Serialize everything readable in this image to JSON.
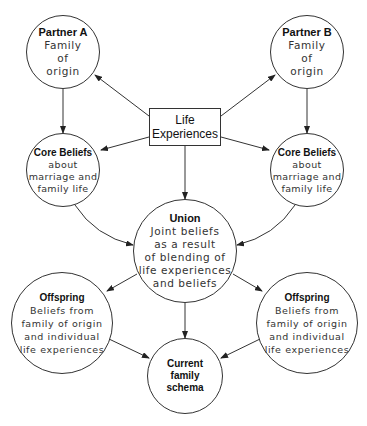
{
  "diagram": {
    "nodes": {
      "partner_a": {
        "title": "Partner A",
        "body": "Family\nof\norigin"
      },
      "partner_b": {
        "title": "Partner B",
        "body": "Family\nof\norigin"
      },
      "life_experiences": {
        "title": "Life\nExperiences"
      },
      "core_beliefs_a": {
        "title": "Core Beliefs",
        "body": "about\nmarriage and\nfamily life"
      },
      "core_beliefs_b": {
        "title": "Core Beliefs",
        "body": "about\nmarriage and\nfamily life"
      },
      "union": {
        "title": "Union",
        "body": "Joint beliefs\nas a result\nof blending of\nlife experiences\nand beliefs"
      },
      "offspring_a": {
        "title": "Offspring",
        "body": "Beliefs from\nfamily of origin\nand individual\nlife experiences"
      },
      "offspring_b": {
        "title": "Offspring",
        "body": "Beliefs from\nfamily of origin\nand individual\nlife experiences"
      },
      "current_schema": {
        "title": "Current\nfamily\nschema"
      }
    },
    "edges": [
      {
        "from": "life_experiences",
        "to": "partner_a"
      },
      {
        "from": "life_experiences",
        "to": "partner_b"
      },
      {
        "from": "life_experiences",
        "to": "core_beliefs_a"
      },
      {
        "from": "life_experiences",
        "to": "core_beliefs_b"
      },
      {
        "from": "life_experiences",
        "to": "union"
      },
      {
        "from": "partner_a",
        "to": "core_beliefs_a"
      },
      {
        "from": "partner_b",
        "to": "core_beliefs_b"
      },
      {
        "from": "core_beliefs_a",
        "to": "union"
      },
      {
        "from": "core_beliefs_b",
        "to": "union"
      },
      {
        "from": "union",
        "to": "offspring_a"
      },
      {
        "from": "union",
        "to": "offspring_b"
      },
      {
        "from": "union",
        "to": "current_schema"
      },
      {
        "from": "offspring_a",
        "to": "current_schema"
      },
      {
        "from": "offspring_b",
        "to": "current_schema"
      }
    ]
  }
}
